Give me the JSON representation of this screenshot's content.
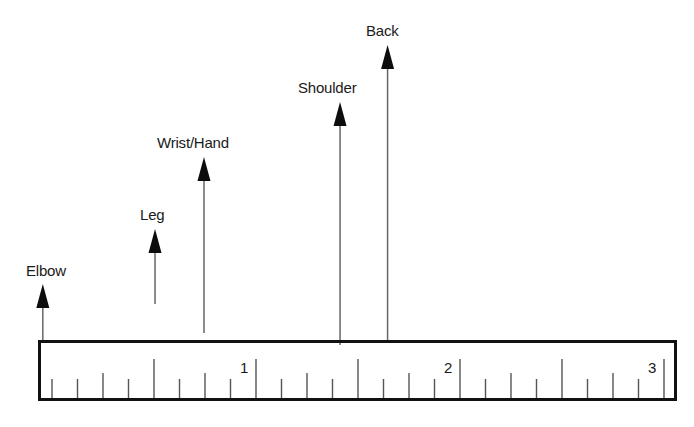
{
  "diagram": {
    "type": "ruler-scale-with-labeled-arrows",
    "colors": {
      "background": "#ffffff",
      "ruler_border": "#111111",
      "tick": "#555555",
      "arrow_shaft": "#666666",
      "arrowhead": "#0d0d0d",
      "text": "#1a1a1a"
    },
    "ruler": {
      "left": 38,
      "top": 340,
      "right": 677,
      "bottom": 401,
      "border_width": 3,
      "zero_x": 52,
      "px_per_unit": 204,
      "subdivisions": 8,
      "max_value": 3,
      "tick_tops": {
        "long": 359,
        "medium": 373,
        "short": 379
      },
      "numbers": [
        {
          "label": "1",
          "value": 1
        },
        {
          "label": "2",
          "value": 2
        },
        {
          "label": "3",
          "value": 3
        }
      ]
    },
    "arrows": [
      {
        "label": "Elbow",
        "value": -0.045,
        "tip_y": 284,
        "shaft_bottom": 340,
        "label_x": 26,
        "label_y": 263
      },
      {
        "label": "Leg",
        "value": 0.505,
        "tip_y": 229,
        "shaft_bottom": 304,
        "label_x": 140,
        "label_y": 207
      },
      {
        "label": "Wrist/Hand",
        "value": 0.745,
        "tip_y": 157,
        "shaft_bottom": 333,
        "label_x": 157,
        "label_y": 135
      },
      {
        "label": "Shoulder",
        "value": 1.412,
        "tip_y": 102,
        "shaft_bottom": 345,
        "label_x": 298,
        "label_y": 80
      },
      {
        "label": "Back",
        "value": 1.645,
        "tip_y": 45,
        "shaft_bottom": 340,
        "label_x": 366,
        "label_y": 23
      }
    ]
  },
  "chart_data": {
    "type": "bar",
    "title": "",
    "xlabel": "",
    "ylabel": "",
    "scale_ticks": [
      "1",
      "2",
      "3"
    ],
    "categories": [
      "Elbow",
      "Leg",
      "Wrist/Hand",
      "Shoulder",
      "Back"
    ],
    "values": [
      0.0,
      0.5,
      0.75,
      1.4,
      1.65
    ],
    "arrow_heights_px": [
      56,
      75,
      176,
      238,
      295
    ],
    "xlim": [
      0,
      3.1
    ]
  }
}
